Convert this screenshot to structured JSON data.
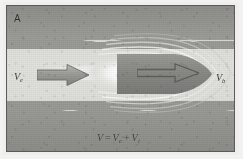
{
  "figure": {
    "panel_letter": "A",
    "type": "fluid-flow-schematic",
    "caption_text_visible": false
  },
  "labels": {
    "inflow_velocity": {
      "symbol": "V",
      "subscript": "e",
      "full": "Ve"
    },
    "body_velocity": {
      "symbol": "V",
      "subscript": "b",
      "full": "Vb"
    }
  },
  "equation": {
    "lhs": "V",
    "operator_equals": "=",
    "term1_symbol": "V",
    "term1_subscript": "e",
    "operator_plus": "+",
    "term2_symbol": "V",
    "term2_subscript": "i",
    "full": "V = Ve + Vi"
  },
  "arrows": {
    "inflow": {
      "name": "inflow-arrow",
      "direction": "right"
    },
    "body": {
      "name": "body-velocity-arrow",
      "direction": "right"
    }
  },
  "scene": {
    "top_band_name": "upper-medium-band",
    "bottom_band_name": "lower-medium-band",
    "stream_name": "free-stream-channel",
    "plume_name": "luminous-wake-plume",
    "body_name": "projectile-body",
    "streamlines_name": "flow-streamlines"
  },
  "colors": {
    "band_dark": "#949490",
    "stream_light": "#e0e0dc",
    "body_fill": "#8b8b87",
    "plume_white": "#ffffff",
    "border": "#5b5b5b",
    "text": "#3a3a38",
    "paper": "#efeeec"
  }
}
